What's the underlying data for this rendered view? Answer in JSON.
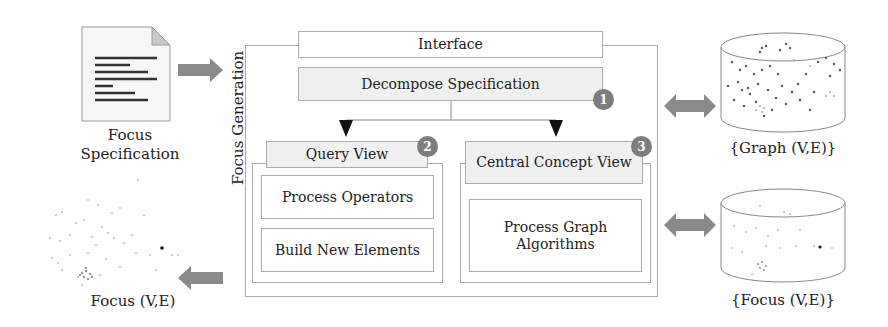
{
  "diagram": {
    "left": {
      "spec_caption_line1": "Focus",
      "spec_caption_line2": "Specification",
      "focus_graph_caption": "Focus (V,E)"
    },
    "frame": {
      "side_label": "Focus Generation",
      "interface_label": "Interface",
      "decompose_label": "Decompose Specification",
      "decompose_step": "1",
      "query_view": {
        "title": "Query View",
        "step": "2",
        "items": [
          "Process Operators",
          "Build New Elements"
        ]
      },
      "central_view": {
        "title": "Central Concept View",
        "step": "3",
        "items": [
          "Process Graph Algorithms"
        ]
      }
    },
    "right": {
      "graph_db_caption": "{Graph (V,E)}",
      "focus_db_caption": "{Focus (V,E)}"
    },
    "colors": {
      "arrow": "#8a8a8a",
      "badge": "#7d7d7d",
      "box_border": "#aaaaaa",
      "shaded_box": "#f0f0f0"
    }
  }
}
